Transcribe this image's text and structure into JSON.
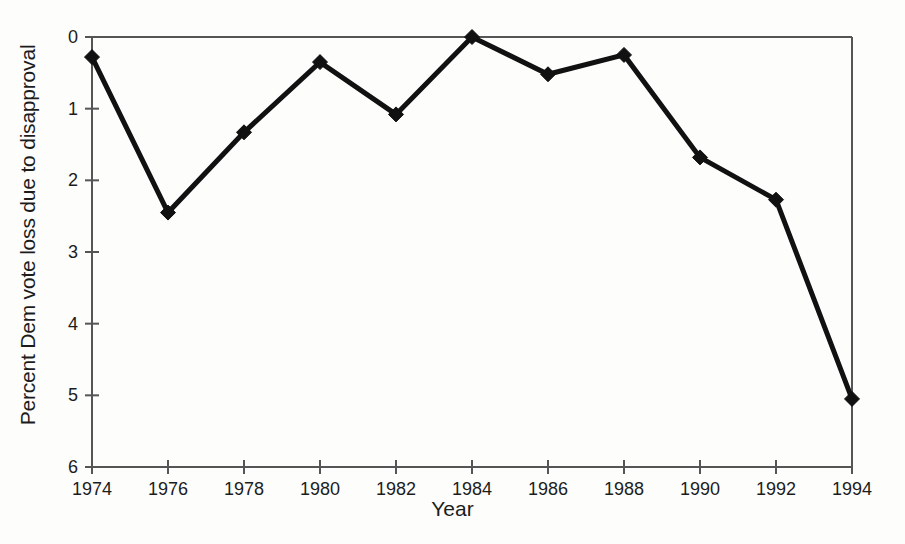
{
  "chart_data": {
    "type": "line",
    "title": "",
    "subtitle": "",
    "xlabel": "Year",
    "ylabel": "Percent Dem vote loss due to disapproval",
    "x": [
      1974,
      1976,
      1978,
      1980,
      1982,
      1984,
      1986,
      1988,
      1990,
      1992,
      1994
    ],
    "values": [
      0.28,
      2.45,
      1.33,
      0.35,
      1.08,
      0.0,
      0.52,
      0.25,
      1.68,
      2.27,
      5.05
    ],
    "xtick_labels": [
      "1974",
      "1976",
      "1978",
      "1980",
      "1982",
      "1984",
      "1986",
      "1988",
      "1990",
      "1992",
      "1994"
    ],
    "ytick_labels": [
      "0",
      "1",
      "2",
      "3",
      "4",
      "5",
      "6"
    ],
    "yticks": [
      0,
      1,
      2,
      3,
      4,
      5,
      6
    ],
    "xlim": [
      1974,
      1994
    ],
    "ylim": [
      0,
      6
    ],
    "y_axis_inverted": true,
    "grid": false,
    "legend": null,
    "legend_position": "none",
    "marker": "diamond",
    "line_color": "#111111",
    "marker_color": "#111111",
    "axis_color": "#555555",
    "background_color": "#fdfdfc"
  },
  "axes": {
    "x_title": "Year",
    "y_title": "Percent Dem vote loss due to disapproval"
  }
}
